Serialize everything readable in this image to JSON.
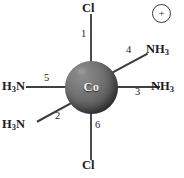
{
  "diagram": {
    "background_color": "#ffffff",
    "bond_color": "#3a3a3a",
    "label_color": "#1c1c1c"
  },
  "center": {
    "symbol": "Co",
    "name": "cobalt-center",
    "sphere_color": "#6d6d6d"
  },
  "charge": {
    "symbol": "+",
    "label": "positive-charge"
  },
  "ligands": [
    {
      "position": "top",
      "formula_main": "Cl",
      "formula_sub": "",
      "bond_number": "1"
    },
    {
      "position": "lower-left",
      "formula_main": "H",
      "formula_sub": "3",
      "formula_tail": "N",
      "bond_number": "2"
    },
    {
      "position": "right",
      "formula_main": "NH",
      "formula_sub": "3",
      "bond_number": "3"
    },
    {
      "position": "upper-right",
      "formula_main": "NH",
      "formula_sub": "3",
      "bond_number": "4"
    },
    {
      "position": "left",
      "formula_main": "H",
      "formula_sub": "3",
      "formula_tail": "N",
      "bond_number": "5"
    },
    {
      "position": "bottom",
      "formula_main": "Cl",
      "formula_sub": "",
      "bond_number": "6"
    }
  ],
  "labels": {
    "top_ligand": "Cl",
    "bottom_ligand": "Cl",
    "left_ligand_main": "H",
    "left_ligand_sub": "3",
    "left_ligand_tail": "N",
    "lowerleft_ligand_main": "H",
    "lowerleft_ligand_sub": "3",
    "lowerleft_ligand_tail": "N",
    "right_ligand_main": "NH",
    "right_ligand_sub": "3",
    "upperright_ligand_main": "NH",
    "upperright_ligand_sub": "3"
  },
  "bond_numbers": {
    "one": "1",
    "two": "2",
    "three": "3",
    "four": "4",
    "five": "5",
    "six": "6"
  }
}
